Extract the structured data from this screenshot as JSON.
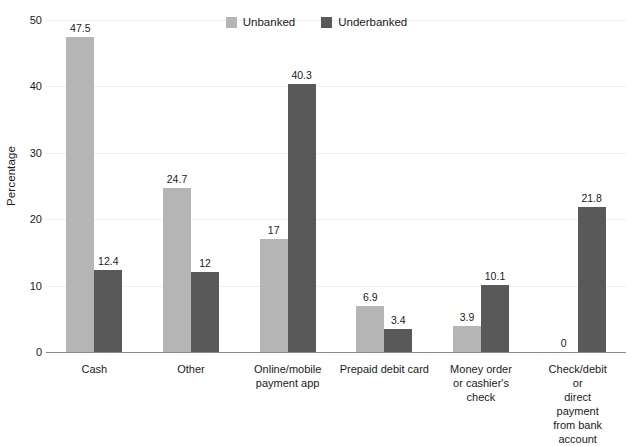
{
  "chart_data": {
    "type": "bar",
    "title": "",
    "xlabel": "",
    "ylabel": "Percentage",
    "ylim": [
      0,
      50
    ],
    "yticks": [
      0,
      10,
      20,
      30,
      40,
      50
    ],
    "ytick_labels": [
      "0",
      "10",
      "20",
      "30",
      "40",
      "50"
    ],
    "grid": true,
    "legend_position": "top-center",
    "categories": [
      "Cash",
      "Other",
      "Online/mobile\npayment app",
      "Prepaid debit card",
      "Money order\nor cashier's\ncheck",
      "Check/debit or\ndirect payment\nfrom bank account"
    ],
    "series": [
      {
        "name": "Unbanked",
        "color": "#b5b5b5",
        "values": [
          47.5,
          24.7,
          17,
          6.9,
          3.9,
          0
        ],
        "value_labels": [
          "47.5",
          "24.7",
          "17",
          "6.9",
          "3.9",
          "0"
        ]
      },
      {
        "name": "Underbanked",
        "color": "#595959",
        "values": [
          12.4,
          12,
          40.3,
          3.4,
          10.1,
          21.8
        ],
        "value_labels": [
          "12.4",
          "12",
          "40.3",
          "3.4",
          "10.1",
          "21.8"
        ]
      }
    ]
  },
  "legend": {
    "items": [
      {
        "label": "Unbanked",
        "color": "#b5b5b5"
      },
      {
        "label": "Underbanked",
        "color": "#595959"
      }
    ]
  },
  "axis": {
    "y_title": "Percentage"
  }
}
